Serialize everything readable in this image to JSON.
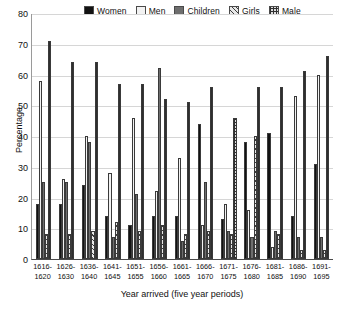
{
  "chart_data": {
    "type": "bar",
    "title": "",
    "xlabel": "Year arrived (five year periods)",
    "ylabel": "Percentage",
    "ylim": [
      0,
      80
    ],
    "yticks": [
      0,
      10,
      20,
      30,
      40,
      50,
      60,
      70,
      80
    ],
    "grid": true,
    "legend_position": "top",
    "categories": [
      "1616-\n1620",
      "1626-\n1630",
      "1636-\n1640",
      "1641-\n1645",
      "1651-\n1655",
      "1656-\n1660",
      "1661-\n1665",
      "1666-\n1670",
      "1671-\n1675",
      "1676-\n1680",
      "1681-\n1685",
      "1686-\n1690",
      "1691-\n1695"
    ],
    "category_lines": [
      [
        "1616-",
        "1620"
      ],
      [
        "1626-",
        "1630"
      ],
      [
        "1636-",
        "1640"
      ],
      [
        "1641-",
        "1645"
      ],
      [
        "1651-",
        "1655"
      ],
      [
        "1656-",
        "1660"
      ],
      [
        "1661-",
        "1665"
      ],
      [
        "1666-",
        "1670"
      ],
      [
        "1671-",
        "1675"
      ],
      [
        "1676-",
        "1680"
      ],
      [
        "1681-",
        "1685"
      ],
      [
        "1686-",
        "1690"
      ],
      [
        "1691-",
        "1695"
      ]
    ],
    "series": [
      {
        "name": "Women",
        "color": "#121212",
        "pattern": "solid-black",
        "values": [
          18,
          18,
          24,
          14,
          11,
          14,
          14,
          44,
          13,
          38,
          41,
          14,
          31
        ]
      },
      {
        "name": "Men",
        "color": "#f2f2f2",
        "pattern": "solid-white",
        "values": [
          58,
          26,
          40,
          28,
          46,
          22,
          33,
          11,
          18,
          16,
          4,
          53,
          60
        ]
      },
      {
        "name": "Children",
        "color": "#6e6e6e",
        "pattern": "solid-gray",
        "values": [
          25,
          25,
          38,
          7,
          21,
          62,
          6,
          25,
          9,
          7,
          9,
          7,
          7
        ]
      },
      {
        "name": "Girls",
        "color": "#3d3d3d",
        "pattern": "diagonal-hatch",
        "values": [
          8,
          8,
          9,
          12,
          9,
          11,
          8,
          9,
          8,
          40,
          8,
          3,
          3
        ]
      },
      {
        "name": "Male",
        "color": "#2f2f2f",
        "pattern": "grid-check",
        "values": [
          71,
          64,
          64,
          57,
          57,
          52,
          51,
          56,
          46,
          56,
          56,
          61,
          66
        ]
      }
    ]
  },
  "legend": {
    "items": [
      {
        "label": "Women",
        "swatch": "solid-black"
      },
      {
        "label": "Men",
        "swatch": "solid-white"
      },
      {
        "label": "Children",
        "swatch": "solid-gray"
      },
      {
        "label": "Girls",
        "swatch": "diagonal-hatch"
      },
      {
        "label": "Male",
        "swatch": "grid-check"
      }
    ]
  }
}
